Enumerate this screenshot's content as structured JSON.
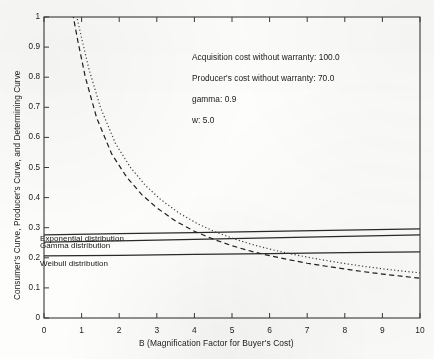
{
  "chart_data": {
    "type": "line",
    "title": "",
    "xlabel": "B (Magnification Factor for Buyer's Cost)",
    "ylabel": "Consumer's Curve, Producer's Curve, and Determining Curve",
    "xlim": [
      0,
      10
    ],
    "ylim": [
      0,
      1
    ],
    "xticks": [
      "0",
      "1",
      "2",
      "3",
      "4",
      "5",
      "6",
      "7",
      "8",
      "9",
      "10"
    ],
    "yticks": [
      "0",
      "0.1",
      "0.2",
      "0.3",
      "0.4",
      "0.5",
      "0.6",
      "0.7",
      "0.8",
      "0.9",
      "1"
    ],
    "grid": false,
    "legend_position": "inline-left",
    "series": [
      {
        "name": "Exponential distribution",
        "style": "solid",
        "x": [
          0.0,
          2.0,
          4.0,
          6.0,
          8.0,
          10.0
        ],
        "values": [
          0.276,
          0.28,
          0.284,
          0.288,
          0.292,
          0.296
        ]
      },
      {
        "name": "Gamma distribution",
        "style": "solid",
        "x": [
          0.0,
          2.0,
          4.0,
          6.0,
          8.0,
          10.0
        ],
        "values": [
          0.252,
          0.256,
          0.261,
          0.266,
          0.271,
          0.276
        ]
      },
      {
        "name": "Weibull distribution",
        "style": "solid",
        "x": [
          0.0,
          2.0,
          4.0,
          6.0,
          8.0,
          10.0
        ],
        "values": [
          0.206,
          0.208,
          0.211,
          0.214,
          0.217,
          0.22
        ]
      },
      {
        "name": "determining-curve-dashed",
        "style": "dashed",
        "x": [
          0.72,
          0.9,
          1.1,
          1.4,
          1.8,
          2.2,
          2.6,
          3.0,
          3.5,
          4.0,
          4.5,
          5.0,
          5.5,
          6.0,
          6.5,
          7.0,
          7.5,
          8.0,
          8.5,
          9.0,
          9.5,
          10.0
        ],
        "values": [
          1.04,
          0.92,
          0.8,
          0.665,
          0.545,
          0.468,
          0.41,
          0.366,
          0.322,
          0.288,
          0.262,
          0.24,
          0.222,
          0.207,
          0.194,
          0.182,
          0.172,
          0.163,
          0.154,
          0.146,
          0.139,
          0.132
        ]
      },
      {
        "name": "determining-curve-dotted",
        "style": "dotted",
        "x": [
          0.8,
          1.0,
          1.2,
          1.5,
          1.9,
          2.3,
          2.7,
          3.1,
          3.6,
          4.1,
          4.6,
          5.1,
          5.6,
          6.1,
          6.6,
          7.1,
          7.6,
          8.1,
          8.6,
          9.1,
          9.6,
          10.0
        ],
        "values": [
          1.04,
          0.93,
          0.825,
          0.7,
          0.58,
          0.5,
          0.44,
          0.394,
          0.348,
          0.312,
          0.284,
          0.261,
          0.242,
          0.226,
          0.212,
          0.2,
          0.189,
          0.179,
          0.17,
          0.162,
          0.155,
          0.15
        ]
      }
    ],
    "annotations": [
      "Acquisition cost without warranty: 100.0",
      "Producer's cost without warranty: 70.0",
      "gamma: 0.9",
      "w: 5.0"
    ],
    "curve_labels": [
      "Exponential distribution",
      "Gamma distribution",
      "Weibull distribution"
    ]
  }
}
